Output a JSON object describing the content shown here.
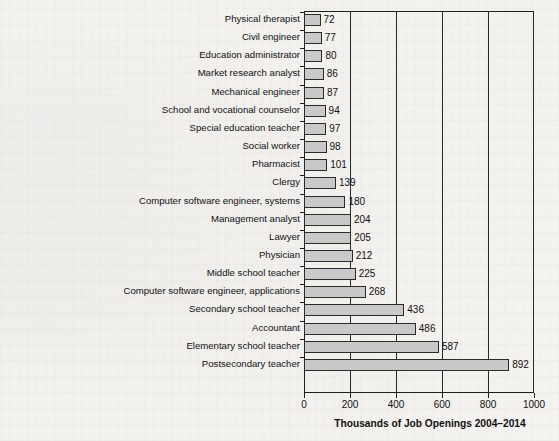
{
  "chart_data": {
    "type": "bar",
    "orientation": "horizontal",
    "title": "",
    "xlabel": "Thousands of Job Openings 2004–2014",
    "ylabel": "",
    "xlim": [
      0,
      1000
    ],
    "xticks": [
      0,
      200,
      400,
      600,
      800,
      1000
    ],
    "grid": "vertical-only",
    "legend": "none",
    "bar_color": "#c9c9c9",
    "bar_edge_color": "#2b2b2b",
    "background_color": "#f6f5f2",
    "categories": [
      "Physical therapist",
      "Civil engineer",
      "Education administrator",
      "Market research analyst",
      "Mechanical engineer",
      "School and vocational counselor",
      "Special education teacher",
      "Social worker",
      "Pharmacist",
      "Clergy",
      "Computer software engineer, systems",
      "Management analyst",
      "Lawyer",
      "Physician",
      "Middle school teacher",
      "Computer software engineer, applications",
      "Secondary school teacher",
      "Accountant",
      "Elementary school teacher",
      "Postsecondary teacher"
    ],
    "values": [
      72,
      77,
      80,
      86,
      87,
      94,
      97,
      98,
      101,
      139,
      180,
      204,
      205,
      212,
      225,
      268,
      436,
      486,
      587,
      892
    ],
    "value_labels": [
      "72",
      "77",
      "80",
      "86",
      "87",
      "94",
      "97",
      "98",
      "101",
      "139",
      "180",
      "204",
      "205",
      "212",
      "225",
      "268",
      "436",
      "486",
      "587",
      "892"
    ],
    "xtick_labels": [
      "0",
      "200",
      "400",
      "600",
      "800",
      "1000"
    ]
  }
}
